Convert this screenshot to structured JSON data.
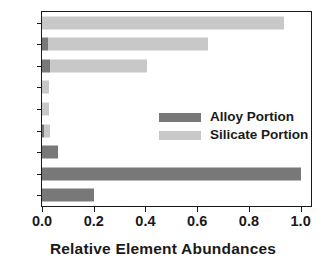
{
  "chart_data": {
    "type": "bar",
    "orientation": "horizontal",
    "stacked": true,
    "title": "",
    "xlabel": "Relative Element Abundances",
    "ylabel": "",
    "xlim": [
      0.0,
      1.04
    ],
    "xticks": [
      "0.0",
      "0.2",
      "0.4",
      "0.6",
      "0.8",
      "1.0"
    ],
    "xtick_values": [
      0.0,
      0.2,
      0.4,
      0.6,
      0.8,
      1.0
    ],
    "grid": false,
    "legend_position": "center-right inside axes",
    "categories": [
      "O",
      "Si",
      "Mg",
      "Na",
      "Al",
      "Ca",
      "Ni",
      "Fe",
      "S"
    ],
    "series": [
      {
        "name": "Alloy Portion",
        "color": "#787878",
        "values": [
          0.0,
          0.025,
          0.03,
          0.0,
          0.0,
          0.008,
          0.063,
          1.0,
          0.2
        ]
      },
      {
        "name": "Silicate Portion",
        "color": "#c8c8c8",
        "values": [
          0.935,
          0.615,
          0.375,
          0.028,
          0.027,
          0.022,
          0.0,
          0.0,
          0.0
        ]
      }
    ],
    "totals": [
      0.935,
      0.64,
      0.405,
      0.028,
      0.027,
      0.03,
      0.063,
      1.0,
      0.2
    ]
  },
  "legend": {
    "entries": [
      {
        "label": "Alloy Portion",
        "color": "#787878"
      },
      {
        "label": "Silicate Portion",
        "color": "#c8c8c8"
      }
    ]
  },
  "colors": {
    "alloy": "#787878",
    "silicate": "#c8c8c8",
    "axis": "#1a1a1a",
    "background": "#ffffff"
  }
}
